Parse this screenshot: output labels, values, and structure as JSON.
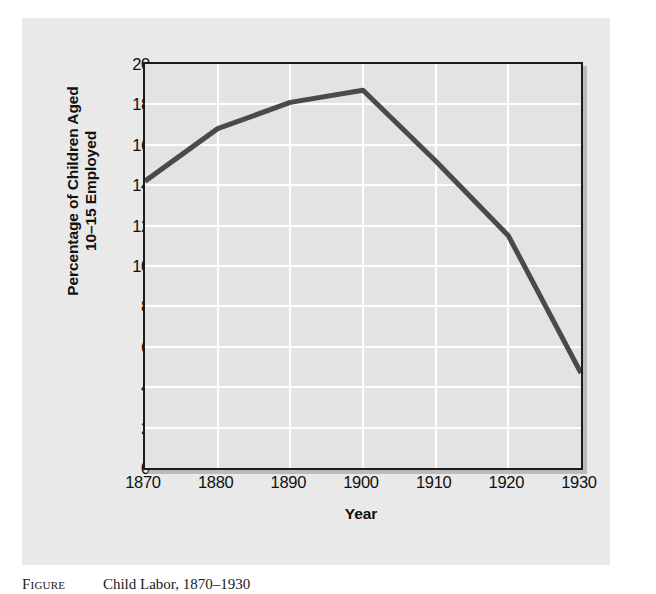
{
  "figure": {
    "caption_label": "Figure",
    "caption_text": "Child Labor, 1870–1930"
  },
  "colors": {
    "panel_background": "#e9e9e9",
    "plot_background": "#e3e3e3",
    "gridline": "#fdfdfd",
    "axis_frame": "#1b1b1b",
    "series_line": "#4a4a4a",
    "text": "#101010"
  },
  "chart_data": {
    "type": "line",
    "title": "",
    "xlabel": "Year",
    "ylabel_line1": "Percentage of Children Aged",
    "ylabel_line2": "10–15 Employed",
    "ylabel": "Percentage of Children Aged 10–15 Employed",
    "x": [
      1870,
      1880,
      1890,
      1900,
      1910,
      1920,
      1930
    ],
    "values": [
      14.2,
      16.8,
      18.1,
      18.7,
      15.2,
      11.5,
      4.7
    ],
    "series": [
      {
        "name": "Percentage of Children Aged 10–15 Employed",
        "values": [
          14.2,
          16.8,
          18.1,
          18.7,
          15.2,
          11.5,
          4.7
        ]
      }
    ],
    "xlim": [
      1870,
      1930
    ],
    "ylim": [
      0,
      20
    ],
    "xticks": [
      1870,
      1880,
      1890,
      1900,
      1910,
      1920,
      1930
    ],
    "xtick_labels": [
      "1870",
      "1880",
      "1890",
      "1900",
      "1910",
      "1920",
      "1930"
    ],
    "yticks": [
      0,
      2,
      4,
      6,
      8,
      10,
      12,
      14,
      16,
      18,
      20
    ],
    "ytick_labels": [
      "0",
      "2",
      "4",
      "6",
      "8",
      "10",
      "12",
      "14",
      "16",
      "18",
      "20"
    ],
    "grid": true,
    "grid_axis": "both",
    "legend": false,
    "legend_position": "none",
    "line_width": 4,
    "markers": false,
    "annotations": []
  }
}
